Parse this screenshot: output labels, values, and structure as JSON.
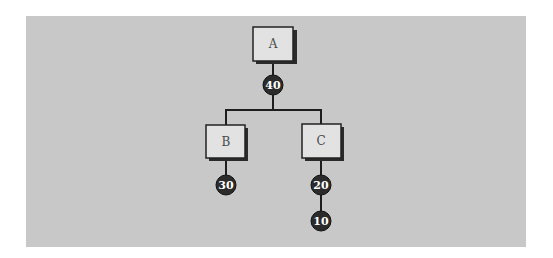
{
  "diagram": {
    "colors": {
      "background": "#c8c8c8",
      "box_fill": "#e2e2e2",
      "box_border": "#222222",
      "box_shadow": "#2a2a2a",
      "connector": "#1e1e1e",
      "circle_fill": "#2b2b2b",
      "circle_text": "#ffffff"
    },
    "nodes": [
      {
        "id": "A",
        "label": "A"
      },
      {
        "id": "B",
        "label": "B"
      },
      {
        "id": "C",
        "label": "C"
      }
    ],
    "weights": [
      {
        "id": "w-A",
        "value": "40",
        "attached_to": "A"
      },
      {
        "id": "w-B",
        "value": "30",
        "attached_to": "B"
      },
      {
        "id": "w-C1",
        "value": "20",
        "attached_to": "C"
      },
      {
        "id": "w-C2",
        "value": "10",
        "attached_to": "C"
      }
    ],
    "edges": [
      {
        "from": "A",
        "to": "B"
      },
      {
        "from": "A",
        "to": "C"
      }
    ]
  }
}
